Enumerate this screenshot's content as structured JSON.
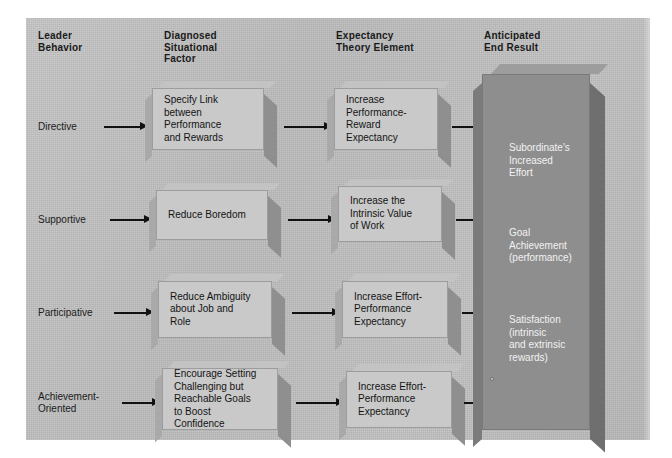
{
  "diagram": {
    "background_color": "#bdbdbd",
    "box_color": "#c9c9c9",
    "end_panel_color": "#8e8e8e",
    "text_color": "#141414",
    "end_panel_text_color": "#f2f2f2"
  },
  "headers": [
    {
      "id": "leader-behavior",
      "label": "Leader\nBehavior"
    },
    {
      "id": "diagnosed-factor",
      "label": "Diagnosed\nSituational\nFactor"
    },
    {
      "id": "expectancy",
      "label": "Expectancy\nTheory Element"
    },
    {
      "id": "end-result",
      "label": "Anticipated\nEnd Result"
    }
  ],
  "rows": [
    {
      "leader_behavior": "Directive",
      "situational_factor": "Specify Link\nbetween\nPerformance\nand Rewards",
      "expectancy_element": "Increase\nPerformance-\nReward\nExpectancy"
    },
    {
      "leader_behavior": "Supportive",
      "situational_factor": "Reduce Boredom",
      "expectancy_element": "Increase the\nIntrinsic Value\nof Work"
    },
    {
      "leader_behavior": "Participative",
      "situational_factor": "Reduce Ambiguity\nabout Job and\nRole",
      "expectancy_element": "Increase Effort-\nPerformance\nExpectancy"
    },
    {
      "leader_behavior": "Achievement-\nOriented",
      "situational_factor": "Encourage Setting\nChallenging but\nReachable Goals\nto Boost\nConfidence",
      "expectancy_element": "Increase Effort-\nPerformance\nExpectancy"
    }
  ],
  "end_result": {
    "items": [
      "Subordinate's\nIncreased\nEffort",
      "Goal\nAchievement\n(performance)",
      "Satisfaction\n(intrinsic\nand extrinsic\nrewards)"
    ]
  }
}
